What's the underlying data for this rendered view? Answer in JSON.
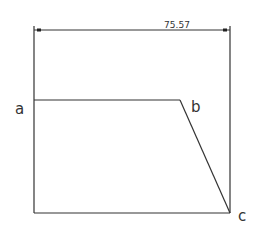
{
  "dimension": {
    "value": "75.57"
  },
  "points": {
    "a": "a",
    "b": "b",
    "c": "c"
  },
  "colors": {
    "stroke": "#333333",
    "background": "#ffffff"
  }
}
